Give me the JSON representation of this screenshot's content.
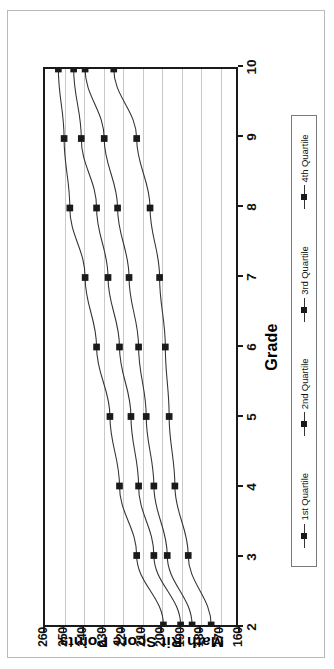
{
  "chart_data": {
    "type": "line",
    "title": "",
    "xlabel": "Grade",
    "ylabel": "Math Rit Score Points",
    "x": [
      2,
      3,
      4,
      5,
      6,
      7,
      8,
      9,
      10
    ],
    "categories": [
      "2",
      "3",
      "4",
      "5",
      "6",
      "7",
      "8",
      "9",
      "10"
    ],
    "xlim": [
      2,
      10
    ],
    "ylim": [
      160,
      260
    ],
    "yticks": [
      260,
      250,
      240,
      230,
      220,
      210,
      200,
      190,
      180,
      170,
      160
    ],
    "ytick_labels": [
      "260",
      "250",
      "240",
      "230",
      "220",
      "210",
      "200",
      "190",
      "180",
      "170",
      "160"
    ],
    "xticks": [
      2,
      3,
      4,
      5,
      6,
      7,
      8,
      9,
      10
    ],
    "xtick_labels": [
      "2",
      "3",
      "4",
      "5",
      "6",
      "7",
      "8",
      "9",
      "10"
    ],
    "grid": "horizontal",
    "legend_position": "bottom",
    "marker": "square",
    "line_color": "#333333",
    "marker_color": "#1a1a1a",
    "orientation": "rotated-90-ccw",
    "series": [
      {
        "name": "1st Quartile",
        "values": [
          198,
          212,
          221,
          226,
          233,
          239,
          247,
          250,
          253
        ]
      },
      {
        "name": "2nd Quartile",
        "values": [
          189,
          203,
          211,
          215,
          221,
          227,
          233,
          241,
          245
        ]
      },
      {
        "name": "3rd Quartile",
        "values": [
          183,
          196,
          203,
          207,
          211,
          216,
          222,
          229,
          239
        ]
      },
      {
        "name": "4th Quartile",
        "values": [
          173,
          185,
          192,
          195,
          197,
          200,
          205,
          212,
          224
        ]
      }
    ]
  },
  "legend": {
    "items": [
      {
        "label": "1st Quartile"
      },
      {
        "label": "2nd Quartile"
      },
      {
        "label": "3rd Quartile"
      },
      {
        "label": "4th Quartile"
      }
    ]
  },
  "axes": {
    "x_title": "Grade",
    "y_title": "Math Rit Score Points"
  }
}
